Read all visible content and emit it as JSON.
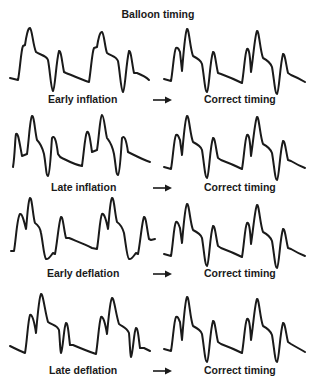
{
  "title": "Balloon timing",
  "colors": {
    "stroke": "#1a1a1a",
    "background": "#ffffff"
  },
  "rows": [
    {
      "left_label": "Early inflation",
      "right_label": "Correct timing",
      "arrow": "right-arrow"
    },
    {
      "left_label": "Late inflation",
      "right_label": "Correct timing",
      "arrow": "right-arrow"
    },
    {
      "left_label": "Early deflation",
      "right_label": "Correct timing",
      "arrow": "right-arrow"
    },
    {
      "left_label": "Late deflation",
      "right_label": "Correct timing",
      "arrow": "right-arrow"
    }
  ]
}
